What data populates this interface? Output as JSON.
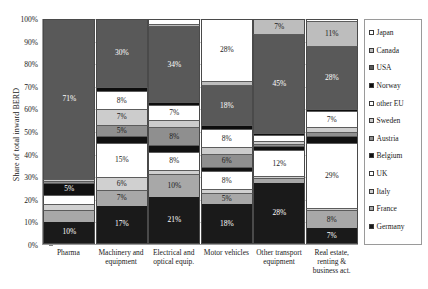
{
  "chart_data": {
    "type": "bar",
    "subtype": "stacked-bar-100-percent",
    "title": "",
    "xlabel": "",
    "ylabel": "Share of total inward BERD",
    "ylim": [
      0,
      100
    ],
    "grid": true,
    "legend_position": "right",
    "ytick_labels": [
      "100%",
      "90%",
      "80%",
      "70%",
      "60%",
      "50%",
      "40%",
      "30%",
      "20%",
      "10%",
      "0%"
    ],
    "ytick_values": [
      100,
      90,
      80,
      70,
      60,
      50,
      40,
      30,
      20,
      10,
      0
    ],
    "categories": [
      "Pharma",
      "Machinery and equipment",
      "Electrical and optical equip.",
      "Motor vehicles",
      "Other transport equipment",
      "Real estate, renting & business act."
    ],
    "series": [
      {
        "name": "Germany",
        "color": "#1a1a1a",
        "values": [
          10,
          17,
          21,
          18,
          28,
          7
        ],
        "labels": [
          "10%",
          "17%",
          "21%",
          "18%",
          "28%",
          "7%"
        ]
      },
      {
        "name": "France",
        "color": "#a8a8a8",
        "values": [
          5,
          7,
          10,
          5,
          2,
          8
        ],
        "labels": [
          "",
          "7%",
          "10%",
          "5%",
          "",
          "8%"
        ]
      },
      {
        "name": "Italy",
        "color": "#d0d0d0",
        "values": [
          3,
          6,
          2,
          2,
          1,
          1
        ],
        "labels": [
          "",
          "6%",
          "",
          "",
          "",
          ""
        ]
      },
      {
        "name": "UK",
        "color": "#ffffff",
        "values": [
          4,
          15,
          8,
          8,
          12,
          29
        ],
        "labels": [
          "",
          "15%",
          "8%",
          "8%",
          "12%",
          "29%"
        ]
      },
      {
        "name": "Belgium",
        "color": "#111111",
        "values": [
          5,
          3,
          3,
          2,
          2,
          3
        ],
        "labels": [
          "5%",
          "",
          "",
          "",
          "",
          ""
        ]
      },
      {
        "name": "Austria",
        "color": "#8f8f8f",
        "values": [
          1,
          5,
          8,
          6,
          1,
          2
        ],
        "labels": [
          "",
          "5%",
          "8%",
          "6%",
          "",
          ""
        ]
      },
      {
        "name": "Sweden",
        "color": "#cccccc",
        "values": [
          1,
          7,
          3,
          3,
          1,
          2
        ],
        "labels": [
          "",
          "7%",
          "",
          "",
          "",
          ""
        ]
      },
      {
        "name": "other EU",
        "color": "#ffffff",
        "values": [
          0,
          8,
          7,
          8,
          3,
          7
        ],
        "labels": [
          "",
          "8%",
          "7%",
          "8%",
          "",
          "7%"
        ]
      },
      {
        "name": "Norway",
        "color": "#0d0d0d",
        "values": [
          0,
          2,
          1,
          2,
          1,
          1
        ],
        "labels": [
          "",
          "",
          "",
          "",
          "",
          ""
        ]
      },
      {
        "name": "USA",
        "color": "#595959",
        "values": [
          71,
          30,
          34,
          18,
          45,
          28
        ],
        "labels": [
          "71%",
          "30%",
          "34%",
          "18%",
          "45%",
          "28%"
        ]
      },
      {
        "name": "Canada",
        "color": "#bdbdbd",
        "values": [
          0,
          0,
          1,
          2,
          7,
          11
        ],
        "labels": [
          "",
          "",
          "",
          "",
          "7%",
          "11%"
        ]
      },
      {
        "name": "Japan",
        "color": "#ffffff",
        "values": [
          0,
          0,
          2,
          28,
          0,
          1
        ],
        "labels": [
          "",
          "",
          "",
          "28%",
          "",
          ""
        ]
      }
    ],
    "legend_entries": [
      {
        "label": "Japan",
        "color": "#ffffff"
      },
      {
        "label": "Canada",
        "color": "#bdbdbd"
      },
      {
        "label": "USA",
        "color": "#595959"
      },
      {
        "label": "Norway",
        "color": "#0d0d0d"
      },
      {
        "label": "other EU",
        "color": "#ffffff"
      },
      {
        "label": "Sweden",
        "color": "#cccccc"
      },
      {
        "label": "Austria",
        "color": "#8f8f8f"
      },
      {
        "label": "Belgium",
        "color": "#111111"
      },
      {
        "label": "UK",
        "color": "#ffffff"
      },
      {
        "label": "Italy",
        "color": "#d0d0d0"
      },
      {
        "label": "France",
        "color": "#a8a8a8"
      },
      {
        "label": "Germany",
        "color": "#1a1a1a"
      }
    ]
  }
}
